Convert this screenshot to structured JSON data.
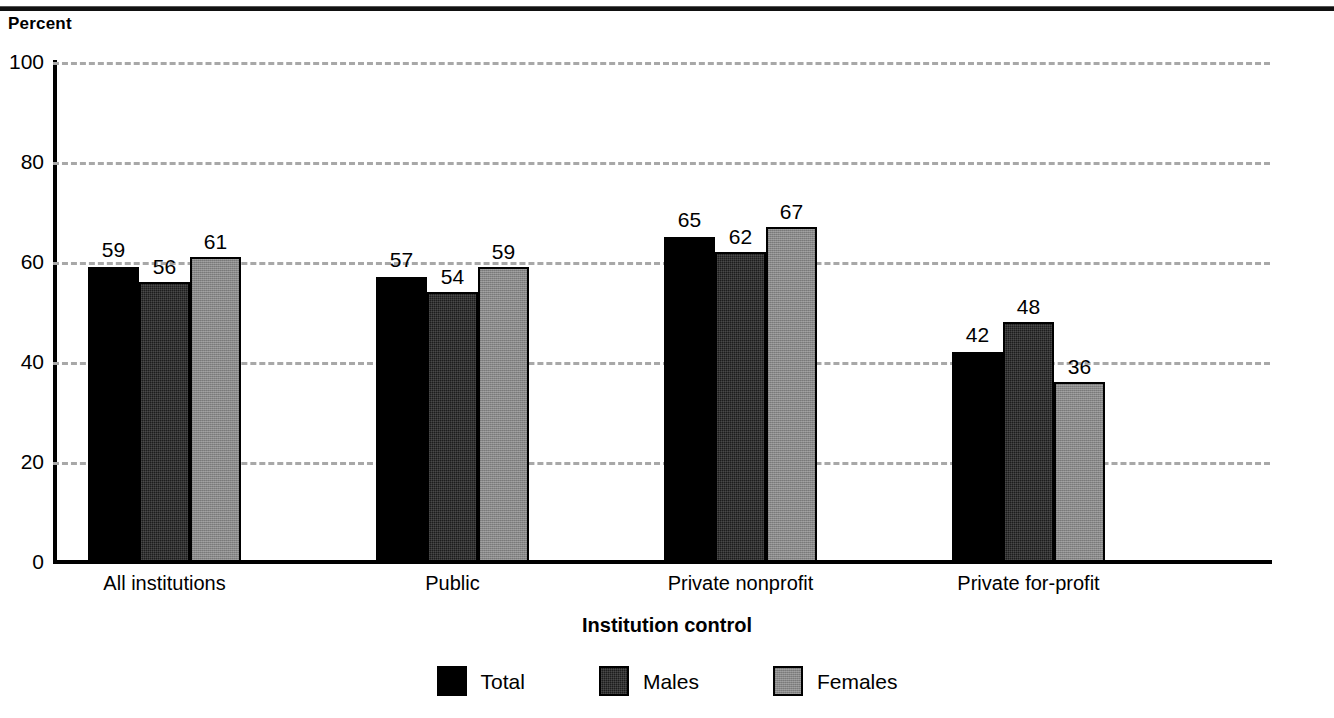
{
  "chart_data": {
    "type": "bar",
    "title": "",
    "subtitle": "",
    "xlabel": "Institution control",
    "ylabel": "Percent",
    "ylim": [
      0,
      100
    ],
    "yticks": [
      0,
      20,
      40,
      60,
      80,
      100
    ],
    "grid": "horizontal-dashed",
    "legend_position": "bottom-center",
    "categories": [
      "All institutions",
      "Public",
      "Private nonprofit",
      "Private for-profit"
    ],
    "series": [
      {
        "name": "Total",
        "color": "#000000",
        "values": [
          59,
          57,
          65,
          42
        ]
      },
      {
        "name": "Males",
        "color": "#1d1d1d",
        "values": [
          56,
          54,
          62,
          48
        ]
      },
      {
        "name": "Females",
        "color": "#878787",
        "values": [
          61,
          59,
          67,
          36
        ]
      }
    ],
    "value_labels": [
      [
        "59",
        "56",
        "61"
      ],
      [
        "57",
        "54",
        "59"
      ],
      [
        "65",
        "62",
        "67"
      ],
      [
        "42",
        "48",
        "36"
      ]
    ]
  },
  "axes": {
    "y_unit_label": "Percent",
    "y_tick_labels": [
      "100",
      "80",
      "60",
      "40",
      "20",
      "0"
    ],
    "x_axis_title": "Institution control",
    "x_tick_labels": [
      "All institutions",
      "Public",
      "Private nonprofit",
      "Private for-profit"
    ]
  },
  "legend": {
    "items": [
      {
        "label": "Total",
        "swatch": "black-solid"
      },
      {
        "label": "Males",
        "swatch": "dark-gray-textured"
      },
      {
        "label": "Females",
        "swatch": "medium-gray-textured"
      }
    ]
  },
  "colors": {
    "total": "#000000",
    "males": "#1d1d1d",
    "females": "#878787",
    "gridline": "#a8a8a8",
    "axis": "#000000",
    "background": "#ffffff"
  }
}
